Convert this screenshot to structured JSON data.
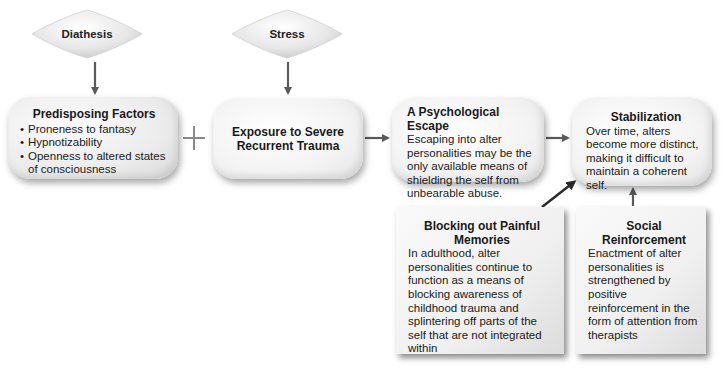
{
  "diagram": {
    "diathesis": {
      "label": "Diathesis"
    },
    "stress": {
      "label": "Stress"
    },
    "predisposing": {
      "title": "Predisposing Factors",
      "items": [
        "Proneness to fantasy",
        "Hypnotizability",
        "Openness to altered states of consciousness"
      ]
    },
    "operator": "+",
    "exposure": {
      "title": "Exposure to Severe Recurrent Trauma"
    },
    "escape": {
      "title": "A Psychological Escape",
      "body": "Escaping into alter personalities may be the only available means of shielding the self from unbearable abuse."
    },
    "stabilization": {
      "title": "Stabilization",
      "body": "Over time, alters become more distinct, making it difficult to maintain a coherent self."
    },
    "blocking": {
      "title": "Blocking out Painful Memories",
      "body": "In adulthood, alter personalities continue to function as a means of blocking awareness of childhood trauma and splintering off parts of the self that are not integrated within"
    },
    "social": {
      "title": "Social Reinforcement",
      "body": "Enactment of alter personalities is strengthened by positive reinforcement in the form of attention from therapists"
    },
    "colors": {
      "arrow": "#5a5a5a",
      "box_fill": "#ececec",
      "text": "#1a1a1a"
    }
  }
}
